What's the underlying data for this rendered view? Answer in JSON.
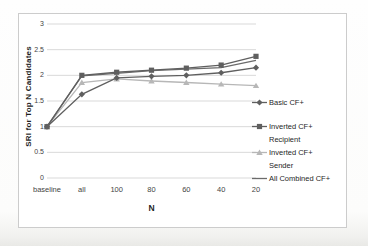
{
  "window": {
    "background": "#fcfcfb"
  },
  "chart_data": {
    "type": "line",
    "title": "",
    "xlabel": "N",
    "ylabel": "SRI for Top N Candidates",
    "categories": [
      "baseline",
      "all",
      "100",
      "80",
      "60",
      "40",
      "20"
    ],
    "ylim": [
      0,
      3
    ],
    "y_ticks": [
      0,
      0.5,
      1,
      1.5,
      2,
      2.5,
      3
    ],
    "y_tick_labels": [
      "0",
      "0.5",
      "1",
      "1.5",
      "2",
      "2.5",
      "3"
    ],
    "grid": "horizontal-only",
    "gridline_color": "#d9d9d9",
    "frame_border_color": "#cccccc",
    "text_color": "#3d3d3d",
    "legend_position": "right",
    "series": [
      {
        "name": "Basic CF+",
        "legend_lines": [
          "Basic CF+"
        ],
        "marker": "diamond",
        "color": "#5f5f5f",
        "values": [
          1,
          1.63,
          1.95,
          1.98,
          2.0,
          2.05,
          2.15
        ]
      },
      {
        "name": "Inverted CF+ Recipient",
        "legend_lines": [
          "Inverted CF+",
          "Recipient"
        ],
        "marker": "square",
        "color": "#5f5f5f",
        "values": [
          1,
          2.0,
          2.06,
          2.1,
          2.14,
          2.2,
          2.37
        ]
      },
      {
        "name": "Inverted CF+ Sender",
        "legend_lines": [
          "Inverted CF+",
          "Sender"
        ],
        "marker": "triangle",
        "color": "#b7b7b7",
        "values": [
          1,
          1.86,
          1.93,
          1.89,
          1.86,
          1.83,
          1.8
        ]
      },
      {
        "name": "All Combined CF+",
        "legend_lines": [
          "All Combined CF+"
        ],
        "marker": "none",
        "color": "#6b6b6b",
        "values": [
          1,
          1.99,
          2.04,
          2.09,
          2.12,
          2.15,
          2.29
        ]
      }
    ]
  }
}
